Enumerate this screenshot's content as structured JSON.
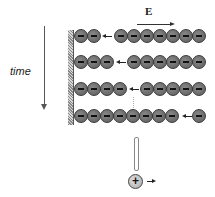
{
  "labels": {
    "time": "time",
    "field": "E"
  },
  "colors": {
    "ion_fill": "#6b6b6b",
    "ion_border": "#3a3a3a",
    "wall": "#999999",
    "arrow": "#222222"
  },
  "rows": [
    {
      "left_ions": 2,
      "arrow": true,
      "right_ions": 7
    },
    {
      "left_ions": 3,
      "arrow": true,
      "right_ions": 6
    },
    {
      "left_ions": 4,
      "arrow": true,
      "right_ions": 5
    },
    {
      "left_ions": 8,
      "arrow": true,
      "right_ions": 1
    }
  ],
  "legend": {
    "positive_ion_symbol": "+",
    "ion_charge_symbol": "−"
  },
  "icons": {
    "time_arrow": "down-arrow-icon",
    "field_arrow": "right-arrow-icon",
    "hollow_arrow": "double-headed-vertical-arrow-icon",
    "positive_ion": "plus-circle-icon"
  }
}
